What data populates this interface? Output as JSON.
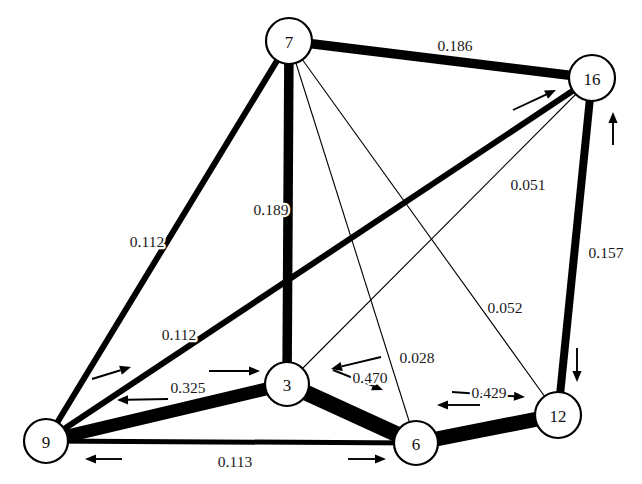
{
  "figure": {
    "type": "network-graph",
    "background_color": "#ffffff",
    "node_fill": "#ffffff",
    "node_stroke": "#000000",
    "edge_color": "#000000",
    "width": 642,
    "height": 484
  },
  "nodes": [
    {
      "id": "7",
      "label": "7",
      "cx": 289,
      "cy": 41,
      "r": 23
    },
    {
      "id": "16",
      "label": "16",
      "cx": 592,
      "cy": 78,
      "r": 23
    },
    {
      "id": "9",
      "label": "9",
      "cx": 46,
      "cy": 441,
      "r": 22
    },
    {
      "id": "3",
      "label": "3",
      "cx": 287,
      "cy": 384,
      "r": 22
    },
    {
      "id": "6",
      "label": "6",
      "cx": 416,
      "cy": 443,
      "r": 22
    },
    {
      "id": "12",
      "label": "12",
      "cx": 558,
      "cy": 415,
      "r": 23
    }
  ],
  "edges": [
    {
      "id": "e-7-16",
      "source": "7",
      "target": "16",
      "value": "0.186",
      "weight": 0.186,
      "thickness": 9.5,
      "label_x": 455,
      "label_y": 45
    },
    {
      "id": "e-7-9",
      "source": "7",
      "target": "9",
      "value": "0.112",
      "weight": 0.112,
      "thickness": 6.0,
      "label_x": 147,
      "label_y": 241
    },
    {
      "id": "e-7-3",
      "source": "7",
      "target": "3",
      "value": "0.189",
      "weight": 0.189,
      "thickness": 9.5,
      "label_x": 271,
      "label_y": 209
    },
    {
      "id": "e-7-6",
      "source": "7",
      "target": "6",
      "value": "0.028",
      "weight": 0.028,
      "thickness": 1.1,
      "label_x": 417,
      "label_y": 357
    },
    {
      "id": "e-7-12",
      "source": "7",
      "target": "12",
      "value": "0.052",
      "weight": 0.052,
      "thickness": 1.1,
      "label_x": 505,
      "label_y": 307
    },
    {
      "id": "e-16-9",
      "source": "16",
      "target": "9",
      "value": "0.112",
      "weight": 0.112,
      "thickness": 6.0,
      "label_x": 179,
      "label_y": 334
    },
    {
      "id": "e-16-3",
      "source": "16",
      "target": "3",
      "value": "0.051",
      "weight": 0.051,
      "thickness": 1.1,
      "label_x": 528,
      "label_y": 184
    },
    {
      "id": "e-16-12",
      "source": "16",
      "target": "12",
      "value": "0.157",
      "weight": 0.157,
      "thickness": 8.0,
      "label_x": 606,
      "label_y": 252
    },
    {
      "id": "e-9-3",
      "source": "9",
      "target": "3",
      "value": "0.325",
      "weight": 0.325,
      "thickness": 13.0,
      "label_x": 188,
      "label_y": 387
    },
    {
      "id": "e-9-6",
      "source": "9",
      "target": "6",
      "value": "0.113",
      "weight": 0.113,
      "thickness": 5.0,
      "label_x": 235,
      "label_y": 461
    },
    {
      "id": "e-3-6",
      "source": "3",
      "target": "6",
      "value": "0.470",
      "weight": 0.47,
      "thickness": 16.0,
      "label_x": 370,
      "label_y": 377
    },
    {
      "id": "e-6-12",
      "source": "6",
      "target": "12",
      "value": "0.429",
      "weight": 0.429,
      "thickness": 15.0,
      "label_x": 489,
      "label_y": 392
    }
  ],
  "direction_arrows": [
    {
      "id": "arrow-9-to-16",
      "x1": 92,
      "y1": 379,
      "x2": 131,
      "y2": 367,
      "note": "toward upper-right"
    },
    {
      "id": "arrow-3-to-9",
      "x1": 168,
      "y1": 399,
      "x2": 117,
      "y2": 400,
      "note": "toward 9"
    },
    {
      "id": "arrow-9-to-3",
      "x1": 209,
      "y1": 371,
      "x2": 260,
      "y2": 371,
      "note": "toward 3"
    },
    {
      "id": "arrow-9-left",
      "x1": 122,
      "y1": 459,
      "x2": 85,
      "y2": 459,
      "note": "toward 9 along bottom"
    },
    {
      "id": "arrow-6-right",
      "x1": 348,
      "y1": 459,
      "x2": 386,
      "y2": 459,
      "note": "toward 6 along bottom"
    },
    {
      "id": "arrow-6-to-3",
      "x1": 381,
      "y1": 357,
      "x2": 331,
      "y2": 369,
      "note": "toward 3"
    },
    {
      "id": "arrow-3-to-6",
      "x1": 333,
      "y1": 370,
      "x2": 383,
      "y2": 390,
      "note": "toward 6"
    },
    {
      "id": "arrow-12-to-6",
      "x1": 480,
      "y1": 405,
      "x2": 437,
      "y2": 405,
      "note": "toward 6"
    },
    {
      "id": "arrow-6-to-12",
      "x1": 452,
      "y1": 392,
      "x2": 525,
      "y2": 397,
      "note": "toward 12"
    },
    {
      "id": "arrow-to-16",
      "x1": 513,
      "y1": 110,
      "x2": 556,
      "y2": 90,
      "note": "toward 16"
    },
    {
      "id": "arrow-12-to-16",
      "x1": 613,
      "y1": 145,
      "x2": 613,
      "y2": 112,
      "note": "upward toward 16"
    },
    {
      "id": "arrow-16-to-12",
      "x1": 577,
      "y1": 348,
      "x2": 577,
      "y2": 382,
      "note": "downward toward 12"
    }
  ]
}
